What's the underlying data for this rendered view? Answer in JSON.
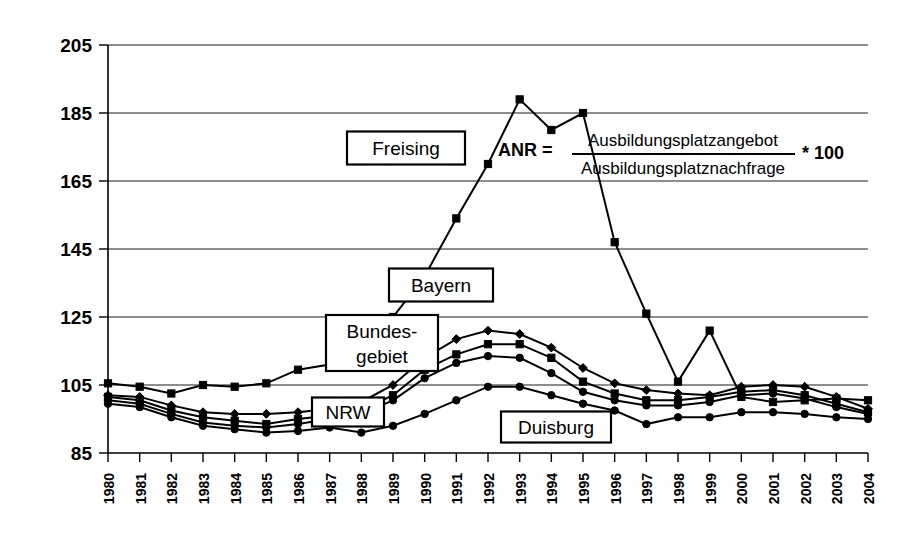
{
  "chart_data": {
    "type": "line",
    "title": "",
    "subtitle": "",
    "xlabel": "",
    "ylabel": "",
    "grid": true,
    "legend_position": "inline-callouts",
    "ylim": [
      85,
      205
    ],
    "yticks": [
      85,
      105,
      125,
      145,
      165,
      185,
      205
    ],
    "x": [
      "1980",
      "1981",
      "1982",
      "1983",
      "1984",
      "1985",
      "1986",
      "1987",
      "1988",
      "1989",
      "1990",
      "1991",
      "1992",
      "1993",
      "1994",
      "1995",
      "1996",
      "1997",
      "1998",
      "1999",
      "2000",
      "2001",
      "2002",
      "2003",
      "2004"
    ],
    "categories": [
      "1980",
      "1981",
      "1982",
      "1983",
      "1984",
      "1985",
      "1986",
      "1987",
      "1988",
      "1989",
      "1990",
      "1991",
      "1992",
      "1993",
      "1994",
      "1995",
      "1996",
      "1997",
      "1998",
      "1999",
      "2000",
      "2001",
      "2002",
      "2003",
      "2004"
    ],
    "series": [
      {
        "name": "Freising",
        "marker": "square",
        "values": [
          105.5,
          104.5,
          102.5,
          105.0,
          104.5,
          105.5,
          109.5,
          111.0,
          117.0,
          125.0,
          137.0,
          154.0,
          170.0,
          189.0,
          180.0,
          185.0,
          147.0,
          126.0,
          106.0,
          121.0,
          101.5,
          100.0,
          100.5,
          101.0,
          100.5
        ]
      },
      {
        "name": "Bayern",
        "marker": "diamond",
        "values": [
          102.0,
          101.5,
          99.0,
          97.0,
          96.5,
          96.5,
          97.0,
          98.0,
          100.0,
          105.0,
          113.0,
          118.5,
          121.0,
          120.0,
          116.0,
          110.0,
          105.5,
          103.5,
          102.5,
          102.0,
          104.5,
          105.0,
          104.5,
          101.5,
          98.0
        ]
      },
      {
        "name": "Bundesgebiet",
        "marker": "square",
        "values": [
          101.5,
          100.5,
          97.5,
          95.5,
          94.5,
          93.5,
          95.0,
          96.0,
          97.5,
          102.0,
          109.5,
          114.0,
          117.0,
          117.0,
          113.0,
          106.0,
          102.5,
          100.5,
          100.5,
          101.5,
          103.0,
          103.5,
          102.0,
          99.5,
          97.0
        ]
      },
      {
        "name": "NRW",
        "marker": "circle",
        "values": [
          100.5,
          99.5,
          96.5,
          94.0,
          93.0,
          92.5,
          93.5,
          95.0,
          96.5,
          100.5,
          107.0,
          111.5,
          113.5,
          113.0,
          108.5,
          103.0,
          100.5,
          99.0,
          99.0,
          100.0,
          102.0,
          102.5,
          101.0,
          98.5,
          96.5
        ]
      },
      {
        "name": "Duisburg",
        "marker": "circle",
        "values": [
          99.5,
          98.5,
          95.5,
          93.0,
          92.0,
          91.0,
          91.5,
          92.5,
          91.0,
          93.0,
          96.5,
          100.5,
          104.5,
          104.5,
          102.0,
          99.5,
          97.5,
          93.5,
          95.5,
          95.5,
          97.0,
          97.0,
          96.5,
          95.5,
          95.0
        ]
      }
    ],
    "annotations": [
      {
        "id": "freising-label",
        "text": "Freising"
      },
      {
        "id": "bayern-label",
        "text": "Bayern"
      },
      {
        "id": "bundesgebiet-label-line1",
        "text": "Bundes-"
      },
      {
        "id": "bundesgebiet-label-line2",
        "text": "gebiet"
      },
      {
        "id": "nrw-label",
        "text": "NRW"
      },
      {
        "id": "duisburg-label",
        "text": "Duisburg"
      }
    ],
    "formula": {
      "lhs": "ANR  =",
      "numerator": "Ausbildungsplatzangebot",
      "denominator": "Ausbildungsplatznachfrage",
      "factor": "* 100"
    }
  },
  "labels": {
    "freising": "Freising",
    "bayern": "Bayern",
    "bundesgebiet_1": "Bundes-",
    "bundesgebiet_2": "gebiet",
    "nrw": "NRW",
    "duisburg": "Duisburg"
  },
  "formula": {
    "lhs": "ANR  =",
    "numerator": "Ausbildungsplatzangebot",
    "denominator": "Ausbildungsplatznachfrage",
    "factor": "* 100"
  },
  "colors": {
    "ink": "#000000",
    "paper": "#ffffff"
  }
}
